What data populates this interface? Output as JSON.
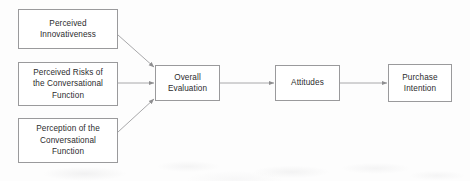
{
  "diagram": {
    "type": "conceptual-path-model",
    "title": "",
    "canvas": {
      "width": 470,
      "height": 181,
      "background": "#fdfdfd"
    },
    "style": {
      "box_border_color": "#9a9a9c",
      "box_fill_color": "#ffffff",
      "connector_color": "#a0a0a2",
      "text_color": "#2c2c2e"
    },
    "nodes": [
      {
        "id": "perceived-innovativeness",
        "label": "Perceived\nInnovativeness",
        "x": 18,
        "y": 9,
        "width": 100,
        "height": 40
      },
      {
        "id": "perceived-risks",
        "label": "Perceived Risks of\nthe Conversational\nFunction",
        "x": 18,
        "y": 62,
        "width": 100,
        "height": 44
      },
      {
        "id": "perception-of-function",
        "label": "Perception of the\nConversational\nFunction",
        "x": 18,
        "y": 118,
        "width": 100,
        "height": 45
      },
      {
        "id": "overall-evaluation",
        "label": "Overall\nEvaluation",
        "x": 155,
        "y": 65,
        "width": 65,
        "height": 36
      },
      {
        "id": "attitudes",
        "label": "Attitudes",
        "x": 275,
        "y": 65,
        "width": 65,
        "height": 36
      },
      {
        "id": "purchase-intention",
        "label": "Purchase\nIntention",
        "x": 388,
        "y": 64,
        "width": 64,
        "height": 38
      }
    ],
    "edges": [
      {
        "id": "edge-innovativeness-to-evaluation",
        "from": "perceived-innovativeness",
        "to": "overall-evaluation",
        "shape": "diagonal-down"
      },
      {
        "id": "edge-risks-to-evaluation",
        "from": "perceived-risks",
        "to": "overall-evaluation",
        "shape": "straight"
      },
      {
        "id": "edge-perception-to-evaluation",
        "from": "perception-of-function",
        "to": "overall-evaluation",
        "shape": "diagonal-up"
      },
      {
        "id": "edge-evaluation-to-attitudes",
        "from": "overall-evaluation",
        "to": "attitudes",
        "shape": "straight"
      },
      {
        "id": "edge-attitudes-to-purchase",
        "from": "attitudes",
        "to": "purchase-intention",
        "shape": "straight"
      }
    ]
  }
}
